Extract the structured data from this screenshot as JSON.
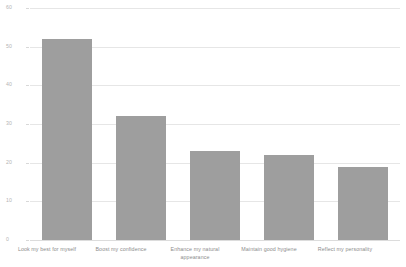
{
  "chart_data": {
    "type": "bar",
    "title": "",
    "subtitle": "",
    "xlabel": "",
    "ylabel": "",
    "categories": [
      "Look my best for myself",
      "Boost my confidence",
      "Enhance my natural appearance",
      "Maintain good hygiene",
      "Reflect my personality"
    ],
    "values": [
      52,
      32,
      23,
      22,
      19
    ],
    "ylim": [
      0,
      60
    ],
    "yticks": [
      0,
      10,
      20,
      30,
      40,
      50,
      60
    ],
    "ytick_labels": [
      "0",
      "10",
      "20",
      "30",
      "40",
      "50",
      "60"
    ],
    "grid": true,
    "legend": false,
    "legend_position": "none",
    "bar_color": "#9e9e9e",
    "gridline_color": "#e6e6e6",
    "background_color": "#ffffff",
    "tick_label_color": "#b4b4b4",
    "category_label_color": "#8c8c8c"
  },
  "axis": {
    "y_ticks": [
      {
        "label": "60",
        "value": 60
      },
      {
        "label": "50",
        "value": 50
      },
      {
        "label": "40",
        "value": 40
      },
      {
        "label": "30",
        "value": 30
      },
      {
        "label": "20",
        "value": 20
      },
      {
        "label": "10",
        "value": 10
      },
      {
        "label": "0",
        "value": 0
      }
    ]
  },
  "bars": [
    {
      "label": "Look my best for myself",
      "label_line1": "Look my best for myself",
      "label_line2": "",
      "value": 52
    },
    {
      "label": "Boost my confidence",
      "label_line1": "Boost my confidence",
      "label_line2": "",
      "value": 32
    },
    {
      "label": "Enhance my natural appearance",
      "label_line1": "Enhance my natural",
      "label_line2": "appearance",
      "value": 23
    },
    {
      "label": "Maintain good hygiene",
      "label_line1": "Maintain good hygiene",
      "label_line2": "",
      "value": 22
    },
    {
      "label": "Reflect my personality",
      "label_line1": "Reflect my personality",
      "label_line2": "",
      "value": 19
    }
  ]
}
